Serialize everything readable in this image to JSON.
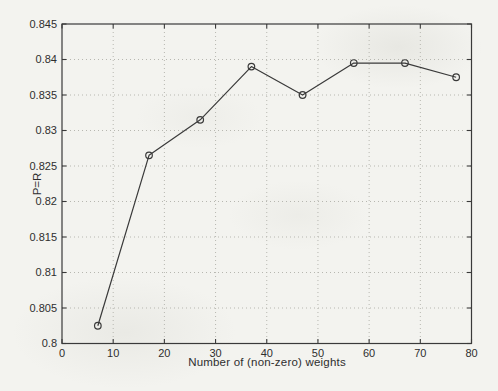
{
  "figure": {
    "background_color": "#f3f3ef",
    "axis_color": "#3a3a3a",
    "grid_color": "#b7b7b0",
    "text_color": "#2e2e2e"
  },
  "chart_data": {
    "type": "line",
    "title": "",
    "xlabel": "Number of (non-zero) weights",
    "ylabel": "P=R",
    "x": [
      7,
      17,
      27,
      37,
      47,
      57,
      67,
      77
    ],
    "y": [
      0.8025,
      0.8265,
      0.8315,
      0.839,
      0.835,
      0.8395,
      0.8395,
      0.8375
    ],
    "xlim": [
      0,
      80
    ],
    "ylim": [
      0.8,
      0.845
    ],
    "xticks": [
      0,
      10,
      20,
      30,
      40,
      50,
      60,
      70,
      80
    ],
    "xtick_labels": [
      "0",
      "10",
      "20",
      "30",
      "40",
      "50",
      "60",
      "70",
      "80"
    ],
    "yticks": [
      0.8,
      0.805,
      0.81,
      0.815,
      0.82,
      0.825,
      0.83,
      0.835,
      0.84,
      0.845
    ],
    "ytick_labels": [
      "0.8",
      "0.805",
      "0.81",
      "0.815",
      "0.82",
      "0.825",
      "0.83",
      "0.835",
      "0.84",
      "0.845"
    ],
    "grid": true,
    "grid_style": "dotted",
    "legend": null,
    "marker": "open-circle",
    "line_color": "#3a3a3a",
    "marker_color": "#3a3a3a"
  }
}
